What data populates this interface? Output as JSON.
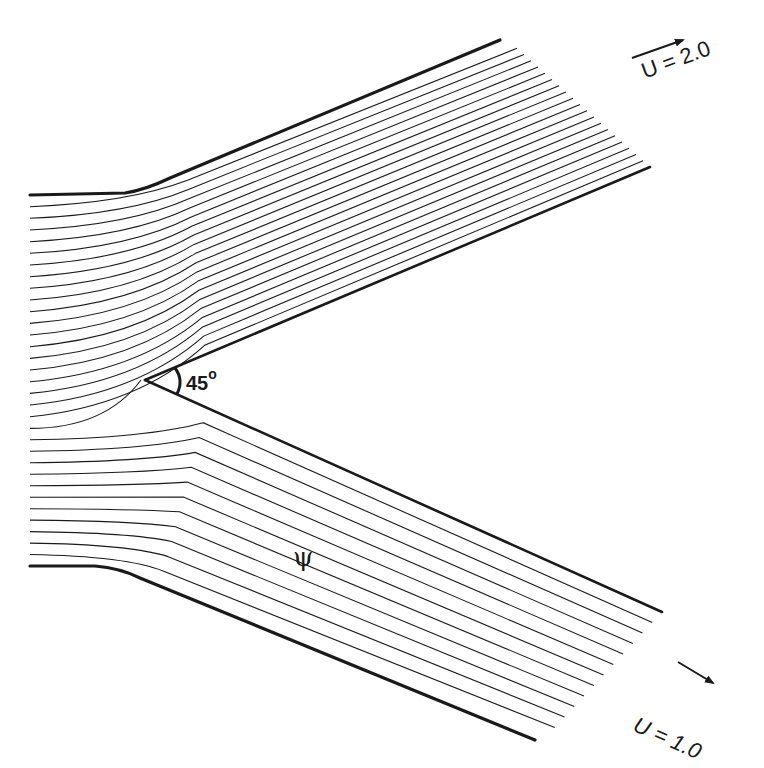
{
  "figure": {
    "type": "streamline diagram",
    "stroke_color": "#1a1a1a",
    "background": "#ffffff"
  },
  "labels": {
    "upper_outlet_velocity": "U = 2.0",
    "lower_outlet_velocity": "U = 1.0",
    "wedge_angle_value": "45",
    "wedge_angle_unit": "o",
    "stream_function_symbol": "ψ"
  },
  "geometry": {
    "wedge_angle_deg": 45,
    "inlet": {
      "top_wall_y": 195,
      "bottom_wall_y": 566,
      "x_start": 30
    },
    "apex": [
      145,
      380
    ],
    "upper_branch": {
      "outer_wall_end": [
        500,
        40
      ],
      "inner_wall_end": [
        650,
        167
      ],
      "streamline_count": 19
    },
    "lower_branch": {
      "outer_wall_end": [
        535,
        740
      ],
      "inner_wall_end": [
        662,
        612
      ],
      "streamline_count": 11
    },
    "inlet_streamline_count": 30
  },
  "arrows": [
    {
      "name": "upper-outlet-arrow",
      "from": [
        632,
        58
      ],
      "to": [
        683,
        40
      ]
    },
    {
      "name": "lower-outlet-arrow",
      "from": [
        678,
        662
      ],
      "to": [
        713,
        683
      ]
    }
  ]
}
